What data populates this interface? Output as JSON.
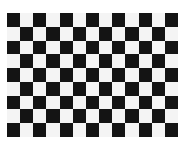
{
  "image": {
    "subject": "checkerboard calibration pattern",
    "rows": 9,
    "columns": 13,
    "top_left_cell": "dark",
    "colors": {
      "dark": "#141414",
      "light": "#f4f4f4",
      "background": "#ffffff"
    }
  }
}
